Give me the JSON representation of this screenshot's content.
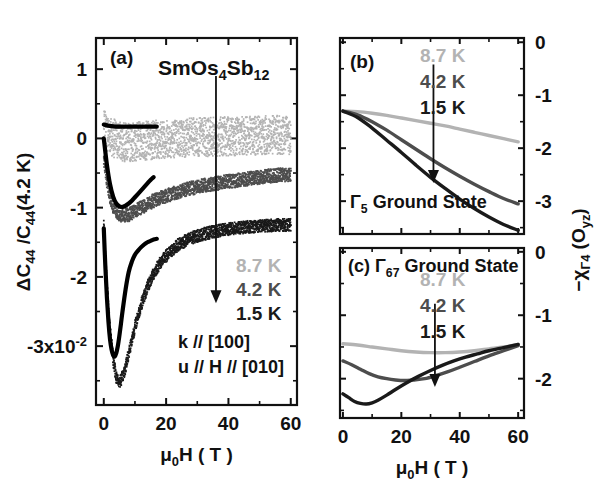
{
  "figure": {
    "title_compound": "SmOs",
    "background": "#ffffff",
    "colors": {
      "t_8_7K": "#b3b3b3",
      "t_4_2K": "#555555",
      "t_1_5K": "#1a1a1a",
      "axis": "#111111",
      "theory": "#000000"
    }
  },
  "panel_a": {
    "label": "(a)",
    "compound": {
      "p1": "SmOs",
      "sub1": "4",
      "p2": "Sb",
      "sub2": "12"
    },
    "ylabel": {
      "delta": "ΔC",
      "sub_a": "44",
      "slash": " /C",
      "sub_b": "44",
      "tail": "(4.2 K)"
    },
    "xlabel": {
      "mu": "μ",
      "sub": "0",
      "rest": "H ( T )"
    },
    "ytick_labels": [
      "1",
      "0",
      "-1",
      "-2",
      "-3x10"
    ],
    "ytick_exponent": "-2",
    "ytick_values": [
      1,
      0,
      -1,
      -2,
      -3
    ],
    "xtick_labels": [
      "0",
      "20",
      "40",
      "60"
    ],
    "xtick_values": [
      0,
      20,
      40,
      60
    ],
    "ylim": [
      -3.85,
      1.45
    ],
    "xlim": [
      -2.5,
      62
    ],
    "legend": [
      {
        "label": "8.7 K",
        "color": "#b3b3b3"
      },
      {
        "label": "4.2 K",
        "color": "#4d4d4d"
      },
      {
        "label": "1.5 K",
        "color": "#1a1a1a"
      }
    ],
    "annotations": [
      "k // [100]",
      "u // H // [010]"
    ],
    "arrow": {
      "x": 36,
      "y_top": 0.9,
      "y_bottom": -2.35
    }
  },
  "panel_b": {
    "label": "(b)",
    "ground_state": {
      "gamma": "Γ",
      "sub": "5",
      "text": " Ground State"
    },
    "ytick_labels": [
      "0",
      "-1",
      "-2",
      "-3"
    ],
    "ytick_values": [
      0,
      -1,
      -2,
      -3
    ],
    "ylim": [
      -3.62,
      0.08
    ],
    "xlim": [
      -1,
      62
    ],
    "legend": [
      {
        "label": "8.7 K",
        "color": "#b3b3b3"
      },
      {
        "label": "4.2 K",
        "color": "#4d4d4d"
      },
      {
        "label": "1.5 K",
        "color": "#1a1a1a"
      }
    ],
    "arrow": {
      "x": 31,
      "y_top": -0.42,
      "y_bottom": -2.62
    }
  },
  "panel_c": {
    "label": "(c)",
    "ground_state": {
      "gamma": "Γ",
      "sub": "67",
      "text": " Ground State"
    },
    "ytick_labels": [
      "0",
      "-1",
      "-2"
    ],
    "ytick_values": [
      0,
      -1,
      -2
    ],
    "ylim": [
      -2.62,
      0.06
    ],
    "xlim": [
      -1,
      62
    ],
    "xtick_labels": [
      "0",
      "20",
      "40",
      "60"
    ],
    "xtick_values": [
      0,
      20,
      40,
      60
    ],
    "xlabel": {
      "mu": "μ",
      "sub": "0",
      "rest": "H ( T )"
    },
    "legend": [
      {
        "label": "8.7 K",
        "color": "#b3b3b3"
      },
      {
        "label": "4.2 K",
        "color": "#4d4d4d"
      },
      {
        "label": "1.5 K",
        "color": "#1a1a1a"
      }
    ],
    "arrow": {
      "x": 31.5,
      "y_top": -0.82,
      "y_bottom": -2.1
    }
  },
  "right_axis_label": {
    "minus": "−",
    "chi": "χ",
    "sub1": "Γ4",
    "open": " (O",
    "sub2": "yz",
    "close": ")"
  },
  "chart_data": {
    "type": "line",
    "panels": [
      {
        "id": "a",
        "label": "(a)",
        "xlabel": "mu0 H (T)",
        "ylabel": "Delta C44 / C44(4.2 K)",
        "y_scale_exponent": -2,
        "xlim": [
          0,
          60
        ],
        "ylim": [
          -3.85,
          1.45
        ],
        "xticks": [
          0,
          20,
          40,
          60
        ],
        "yticks": [
          1,
          0,
          -1,
          -2,
          -3
        ],
        "grid": false,
        "legend_position": "inside-right",
        "annotations": [
          "SmOs4Sb12",
          "k // [100]",
          "u // H // [010]"
        ],
        "series": [
          {
            "name": "8.7 K (data)",
            "color": "#b3b3b3",
            "style": "noisy-band",
            "noise": 0.28,
            "x": [
              0,
              2,
              4,
              6,
              8,
              10,
              14,
              18,
              22,
              26,
              30,
              34,
              38,
              42,
              46,
              50,
              54,
              58,
              60
            ],
            "y": [
              0.12,
              0.05,
              -0.02,
              -0.05,
              -0.06,
              -0.05,
              -0.03,
              -0.01,
              0.0,
              0.01,
              0.02,
              0.02,
              0.03,
              0.03,
              0.04,
              0.04,
              0.05,
              0.05,
              0.05
            ]
          },
          {
            "name": "4.2 K (data)",
            "color": "#4d4d4d",
            "style": "noisy-band",
            "noise": 0.1,
            "x": [
              0,
              1,
              2,
              3,
              4,
              5,
              6,
              8,
              10,
              12,
              14,
              16,
              20,
              24,
              28,
              32,
              36,
              40,
              44,
              48,
              52,
              56,
              60
            ],
            "y": [
              -0.3,
              -0.62,
              -0.85,
              -0.98,
              -1.06,
              -1.1,
              -1.12,
              -1.1,
              -1.06,
              -1.0,
              -0.95,
              -0.9,
              -0.83,
              -0.77,
              -0.72,
              -0.68,
              -0.65,
              -0.62,
              -0.6,
              -0.57,
              -0.55,
              -0.53,
              -0.52
            ]
          },
          {
            "name": "1.5 K (data)",
            "color": "#1a1a1a",
            "style": "noisy-band",
            "noise": 0.09,
            "x": [
              0,
              1,
              2,
              3,
              4,
              5,
              6,
              7,
              8,
              10,
              12,
              14,
              16,
              18,
              20,
              24,
              28,
              32,
              36,
              40,
              44,
              48,
              52,
              56,
              60
            ],
            "y": [
              -1.25,
              -2.1,
              -2.75,
              -3.2,
              -3.45,
              -3.52,
              -3.45,
              -3.3,
              -3.1,
              -2.72,
              -2.4,
              -2.15,
              -1.95,
              -1.8,
              -1.7,
              -1.53,
              -1.44,
              -1.38,
              -1.34,
              -1.31,
              -1.29,
              -1.27,
              -1.26,
              -1.25,
              -1.25
            ]
          },
          {
            "name": "8.7 K (theory)",
            "color": "#000000",
            "style": "solid",
            "x": [
              0,
              2,
              4,
              6,
              8,
              10,
              12,
              14,
              16,
              17
            ],
            "y": [
              0.2,
              0.18,
              0.17,
              0.17,
              0.17,
              0.17,
              0.17,
              0.17,
              0.17,
              0.17
            ]
          },
          {
            "name": "4.2 K (theory)",
            "color": "#000000",
            "style": "solid",
            "x": [
              0,
              1,
              2,
              3,
              4,
              5,
              6,
              7,
              8,
              9,
              10,
              11,
              12,
              13,
              14,
              15,
              16
            ],
            "y": [
              0.0,
              -0.38,
              -0.66,
              -0.84,
              -0.94,
              -0.98,
              -0.99,
              -0.97,
              -0.94,
              -0.9,
              -0.85,
              -0.8,
              -0.75,
              -0.7,
              -0.65,
              -0.6,
              -0.56
            ]
          },
          {
            "name": "1.5 K (theory)",
            "color": "#000000",
            "style": "solid",
            "x": [
              0,
              0.5,
              1,
              1.5,
              2,
              2.5,
              3,
              3.5,
              4,
              4.5,
              5,
              5.5,
              6,
              7,
              8,
              9,
              10,
              11,
              12,
              13,
              14,
              15,
              16,
              17
            ],
            "y": [
              -1.3,
              -1.85,
              -2.3,
              -2.65,
              -2.9,
              -3.05,
              -3.13,
              -3.15,
              -3.1,
              -3.0,
              -2.85,
              -2.68,
              -2.5,
              -2.18,
              -1.93,
              -1.78,
              -1.68,
              -1.62,
              -1.57,
              -1.53,
              -1.5,
              -1.48,
              -1.46,
              -1.45
            ]
          }
        ]
      },
      {
        "id": "b",
        "label": "(b)",
        "title": "Gamma5 Ground State",
        "ylabel": "-chi_Gamma4 (O_yz)",
        "xlim": [
          0,
          60
        ],
        "ylim": [
          -3.62,
          0.08
        ],
        "yticks": [
          0,
          -1,
          -2,
          -3
        ],
        "grid": false,
        "series": [
          {
            "name": "8.7 K",
            "color": "#b3b3b3",
            "x": [
              0,
              5,
              10,
              15,
              20,
              25,
              30,
              35,
              40,
              45,
              50,
              55,
              60
            ],
            "y": [
              -1.3,
              -1.31,
              -1.34,
              -1.38,
              -1.43,
              -1.48,
              -1.53,
              -1.58,
              -1.64,
              -1.7,
              -1.76,
              -1.82,
              -1.88
            ]
          },
          {
            "name": "4.2 K",
            "color": "#4d4d4d",
            "x": [
              0,
              5,
              10,
              15,
              20,
              25,
              30,
              35,
              40,
              45,
              50,
              55,
              60
            ],
            "y": [
              -1.3,
              -1.37,
              -1.5,
              -1.66,
              -1.84,
              -2.02,
              -2.2,
              -2.37,
              -2.53,
              -2.68,
              -2.82,
              -2.95,
              -3.05
            ]
          },
          {
            "name": "1.5 K",
            "color": "#1a1a1a",
            "x": [
              0,
              5,
              10,
              15,
              20,
              25,
              30,
              35,
              40,
              45,
              50,
              55,
              60
            ],
            "y": [
              -1.3,
              -1.42,
              -1.62,
              -1.85,
              -2.08,
              -2.32,
              -2.55,
              -2.76,
              -2.96,
              -3.14,
              -3.3,
              -3.44,
              -3.55
            ]
          }
        ]
      },
      {
        "id": "c",
        "label": "(c)",
        "title": "Gamma67 Ground State",
        "xlabel": "mu0 H (T)",
        "xlim": [
          0,
          60
        ],
        "ylim": [
          -2.62,
          0.06
        ],
        "xticks": [
          0,
          20,
          40,
          60
        ],
        "yticks": [
          0,
          -1,
          -2
        ],
        "grid": false,
        "series": [
          {
            "name": "8.7 K",
            "color": "#b3b3b3",
            "x": [
              0,
              5,
              10,
              15,
              20,
              25,
              30,
              35,
              40,
              45,
              50,
              55,
              60
            ],
            "y": [
              -1.45,
              -1.47,
              -1.5,
              -1.53,
              -1.56,
              -1.58,
              -1.59,
              -1.59,
              -1.58,
              -1.56,
              -1.53,
              -1.5,
              -1.46
            ]
          },
          {
            "name": "4.2 K",
            "color": "#4d4d4d",
            "x": [
              0,
              3,
              6,
              9,
              12,
              15,
              18,
              21,
              24,
              28,
              32,
              36,
              40,
              45,
              50,
              55,
              60
            ],
            "y": [
              -1.72,
              -1.78,
              -1.85,
              -1.92,
              -1.97,
              -2.0,
              -2.02,
              -2.03,
              -2.02,
              -2.0,
              -1.95,
              -1.89,
              -1.82,
              -1.73,
              -1.64,
              -1.56,
              -1.48
            ]
          },
          {
            "name": "1.5 K",
            "color": "#1a1a1a",
            "x": [
              0,
              2,
              4,
              6,
              8,
              10,
              12,
              15,
              18,
              22,
              26,
              30,
              34,
              38,
              42,
              46,
              50,
              55,
              60
            ],
            "y": [
              -2.24,
              -2.3,
              -2.36,
              -2.39,
              -2.4,
              -2.38,
              -2.34,
              -2.26,
              -2.17,
              -2.06,
              -1.96,
              -1.87,
              -1.79,
              -1.72,
              -1.66,
              -1.61,
              -1.56,
              -1.51,
              -1.46
            ]
          }
        ]
      }
    ]
  }
}
